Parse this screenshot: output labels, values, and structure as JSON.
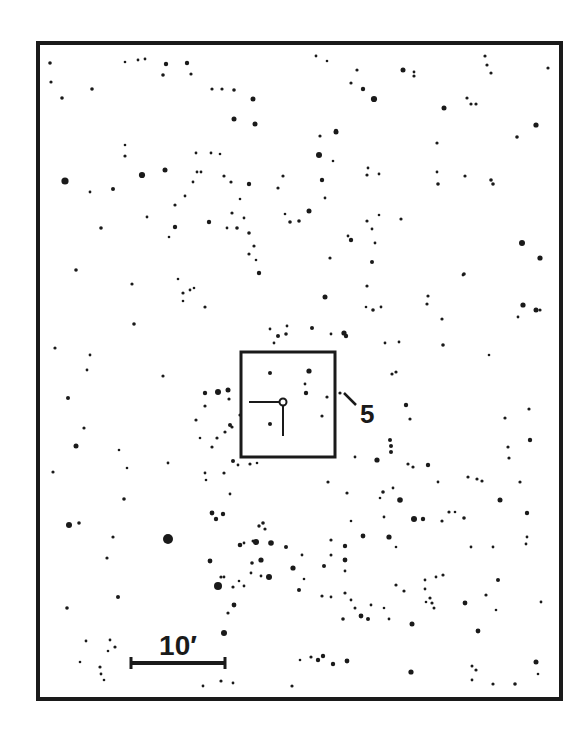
{
  "chart_data": {
    "type": "scatter",
    "frame": {
      "x": 38,
      "y": 43,
      "width": 523,
      "height": 656
    },
    "target_box": {
      "x": 241,
      "y": 352,
      "width": 94,
      "height": 105
    },
    "target": {
      "x": 283,
      "y": 402,
      "radius": 3.5
    },
    "reticle": {
      "h": {
        "x1": 249,
        "x2": 279,
        "y": 402
      },
      "v": {
        "x": 283,
        "y1": 406,
        "y2": 436
      }
    },
    "label": {
      "text": "5",
      "x": 360,
      "y": 423,
      "size": 26
    },
    "leader": {
      "x1": 344,
      "y1": 393,
      "x2": 356,
      "y2": 405
    },
    "scale_bar": {
      "label": "10′",
      "x1": 131,
      "x2": 225,
      "y": 663,
      "label_x": 178,
      "label_y": 655,
      "label_size": 28
    },
    "stars": [
      [
        50,
        63,
        1.8
      ],
      [
        51,
        82,
        1.6
      ],
      [
        62,
        98,
        1.8
      ],
      [
        92,
        89,
        1.8
      ],
      [
        65,
        181,
        3.6
      ],
      [
        90,
        192,
        1.4
      ],
      [
        113,
        189,
        2.0
      ],
      [
        125,
        145,
        1.3
      ],
      [
        125,
        156,
        1.6
      ],
      [
        142,
        175,
        3.1
      ],
      [
        165,
        170,
        2.5
      ],
      [
        175,
        227,
        2.2
      ],
      [
        209,
        222,
        2.2
      ],
      [
        185,
        196,
        1.4
      ],
      [
        193,
        182,
        1.4
      ],
      [
        201,
        172,
        1.4
      ],
      [
        125,
        62,
        1.3
      ],
      [
        138,
        60,
        1.4
      ],
      [
        145,
        59,
        1.4
      ],
      [
        166,
        64,
        2.2
      ],
      [
        187,
        63,
        2.2
      ],
      [
        163,
        75,
        1.8
      ],
      [
        191,
        74,
        1.6
      ],
      [
        212,
        89,
        1.6
      ],
      [
        222,
        89,
        1.6
      ],
      [
        234,
        90,
        1.8
      ],
      [
        253,
        99,
        2.5
      ],
      [
        234,
        119,
        2.5
      ],
      [
        255,
        124,
        2.5
      ],
      [
        196,
        153,
        1.4
      ],
      [
        211,
        153,
        1.4
      ],
      [
        220,
        154,
        1.3
      ],
      [
        197,
        172,
        1.4
      ],
      [
        224,
        176,
        1.6
      ],
      [
        231,
        182,
        1.6
      ],
      [
        249,
        184,
        2.2
      ],
      [
        240,
        199,
        1.3
      ],
      [
        283,
        176,
        1.6
      ],
      [
        278,
        188,
        1.6
      ],
      [
        244,
        218,
        1.4
      ],
      [
        249,
        233,
        1.8
      ],
      [
        237,
        228,
        1.8
      ],
      [
        232,
        213,
        1.6
      ],
      [
        227,
        228,
        1.4
      ],
      [
        316,
        56,
        1.4
      ],
      [
        327,
        61,
        1.3
      ],
      [
        357,
        70,
        1.6
      ],
      [
        403,
        70,
        2.5
      ],
      [
        414,
        76,
        1.6
      ],
      [
        414,
        72,
        1.4
      ],
      [
        351,
        83,
        1.6
      ],
      [
        363,
        89,
        2.2
      ],
      [
        374,
        99,
        3.1
      ],
      [
        285,
        214,
        1.3
      ],
      [
        290,
        222,
        1.8
      ],
      [
        299,
        221,
        1.8
      ],
      [
        309,
        211,
        2.5
      ],
      [
        319,
        155,
        3.0
      ],
      [
        325,
        198,
        1.4
      ],
      [
        333,
        161,
        1.3
      ],
      [
        336,
        132,
        2.5
      ],
      [
        320,
        136,
        1.6
      ],
      [
        444,
        108,
        2.5
      ],
      [
        467,
        98,
        1.6
      ],
      [
        471,
        104,
        1.6
      ],
      [
        476,
        104,
        1.6
      ],
      [
        491,
        180,
        1.8
      ],
      [
        493,
        184,
        1.8
      ],
      [
        485,
        56,
        1.6
      ],
      [
        487,
        65,
        1.6
      ],
      [
        491,
        73,
        1.6
      ],
      [
        548,
        68,
        1.6
      ],
      [
        536,
        125,
        2.6
      ],
      [
        517,
        137,
        1.8
      ],
      [
        465,
        176,
        1.6
      ],
      [
        438,
        184,
        1.8
      ],
      [
        437,
        172,
        1.4
      ],
      [
        368,
        168,
        1.4
      ],
      [
        367,
        175,
        1.6
      ],
      [
        379,
        174,
        1.4
      ],
      [
        437,
        143,
        1.6
      ],
      [
        336,
        131,
        2.2
      ],
      [
        322,
        180,
        2.2
      ],
      [
        76,
        270,
        1.8
      ],
      [
        132,
        284,
        1.6
      ],
      [
        134,
        324,
        1.8
      ],
      [
        101,
        228,
        1.8
      ],
      [
        147,
        217,
        1.4
      ],
      [
        169,
        237,
        1.3
      ],
      [
        175,
        205,
        1.6
      ],
      [
        178,
        279,
        1.3
      ],
      [
        183,
        293,
        1.6
      ],
      [
        183,
        301,
        1.3
      ],
      [
        194,
        288,
        1.3
      ],
      [
        205,
        307,
        1.6
      ],
      [
        190,
        290,
        1.4
      ],
      [
        249,
        254,
        1.6
      ],
      [
        254,
        246,
        1.6
      ],
      [
        256,
        260,
        1.3
      ],
      [
        259,
        273,
        2.2
      ],
      [
        270,
        329,
        1.4
      ],
      [
        287,
        326,
        1.4
      ],
      [
        278,
        336,
        2.0
      ],
      [
        286,
        334,
        1.8
      ],
      [
        312,
        328,
        2.0
      ],
      [
        325,
        297,
        2.5
      ],
      [
        344,
        333,
        2.6
      ],
      [
        346,
        336,
        2.2
      ],
      [
        331,
        334,
        1.4
      ],
      [
        274,
        343,
        1.4
      ],
      [
        367,
        221,
        1.6
      ],
      [
        379,
        215,
        1.3
      ],
      [
        372,
        229,
        1.4
      ],
      [
        351,
        240,
        2.2
      ],
      [
        348,
        236,
        1.4
      ],
      [
        372,
        262,
        2.0
      ],
      [
        375,
        243,
        1.4
      ],
      [
        330,
        258,
        1.6
      ],
      [
        367,
        286,
        1.6
      ],
      [
        366,
        307,
        1.3
      ],
      [
        381,
        307,
        1.4
      ],
      [
        373,
        310,
        1.8
      ],
      [
        401,
        219,
        1.6
      ],
      [
        442,
        319,
        1.6
      ],
      [
        428,
        296,
        1.6
      ],
      [
        427,
        304,
        1.6
      ],
      [
        399,
        342,
        1.4
      ],
      [
        385,
        343,
        1.4
      ],
      [
        443,
        345,
        1.8
      ],
      [
        463,
        275,
        1.4
      ],
      [
        522,
        243,
        3.0
      ],
      [
        540,
        258,
        2.6
      ],
      [
        518,
        317,
        1.4
      ],
      [
        540,
        310,
        1.6
      ],
      [
        464,
        274,
        1.8
      ],
      [
        523,
        305,
        2.6
      ],
      [
        536,
        310,
        2.5
      ],
      [
        489,
        355,
        1.3
      ],
      [
        55,
        348,
        1.6
      ],
      [
        90,
        355,
        1.4
      ],
      [
        87,
        370,
        1.4
      ],
      [
        68,
        398,
        2.0
      ],
      [
        76,
        446,
        2.5
      ],
      [
        53,
        472,
        1.6
      ],
      [
        69,
        525,
        3.0
      ],
      [
        79,
        523,
        1.8
      ],
      [
        84,
        428,
        1.6
      ],
      [
        119,
        450,
        1.3
      ],
      [
        127,
        468,
        1.3
      ],
      [
        113,
        537,
        1.6
      ],
      [
        124,
        499,
        1.8
      ],
      [
        163,
        376,
        1.6
      ],
      [
        168,
        463,
        1.4
      ],
      [
        205,
        393,
        2.2
      ],
      [
        205,
        473,
        1.4
      ],
      [
        218,
        392,
        3.0
      ],
      [
        228,
        390,
        2.5
      ],
      [
        229,
        399,
        1.6
      ],
      [
        225,
        432,
        1.6
      ],
      [
        230,
        425,
        2.0
      ],
      [
        205,
        406,
        1.6
      ],
      [
        212,
        447,
        1.6
      ],
      [
        217,
        438,
        1.6
      ],
      [
        233,
        461,
        2.0
      ],
      [
        232,
        427,
        1.6
      ],
      [
        240,
        415,
        1.6
      ],
      [
        250,
        464,
        1.6
      ],
      [
        238,
        465,
        1.4
      ],
      [
        257,
        463,
        1.3
      ],
      [
        206,
        480,
        1.3
      ],
      [
        224,
        473,
        1.6
      ],
      [
        196,
        420,
        1.6
      ],
      [
        200,
        438,
        1.3
      ],
      [
        270,
        373,
        2.0
      ],
      [
        309,
        371,
        2.6
      ],
      [
        305,
        384,
        1.4
      ],
      [
        306,
        393,
        2.2
      ],
      [
        322,
        416,
        1.6
      ],
      [
        270,
        424,
        2.0
      ],
      [
        327,
        397,
        1.6
      ],
      [
        340,
        393,
        1.6
      ],
      [
        392,
        374,
        1.6
      ],
      [
        396,
        372,
        1.6
      ],
      [
        406,
        405,
        2.2
      ],
      [
        410,
        419,
        1.6
      ],
      [
        390,
        440,
        2.0
      ],
      [
        391,
        446,
        2.0
      ],
      [
        391,
        452,
        2.0
      ],
      [
        355,
        457,
        1.4
      ],
      [
        377,
        460,
        2.6
      ],
      [
        408,
        464,
        1.6
      ],
      [
        413,
        467,
        1.6
      ],
      [
        428,
        465,
        2.2
      ],
      [
        393,
        488,
        1.4
      ],
      [
        328,
        482,
        1.6
      ],
      [
        383,
        492,
        1.8
      ],
      [
        380,
        498,
        1.3
      ],
      [
        438,
        482,
        1.4
      ],
      [
        468,
        477,
        1.6
      ],
      [
        477,
        479,
        1.6
      ],
      [
        500,
        500,
        2.5
      ],
      [
        520,
        482,
        1.6
      ],
      [
        482,
        481,
        1.6
      ],
      [
        530,
        440,
        2.2
      ],
      [
        529,
        409,
        1.6
      ],
      [
        505,
        418,
        1.6
      ],
      [
        508,
        447,
        1.6
      ],
      [
        509,
        458,
        1.6
      ],
      [
        384,
        517,
        1.4
      ],
      [
        400,
        500,
        2.8
      ],
      [
        414,
        519,
        3.0
      ],
      [
        423,
        519,
        2.2
      ],
      [
        442,
        521,
        1.6
      ],
      [
        449,
        512,
        1.6
      ],
      [
        455,
        512,
        1.3
      ],
      [
        464,
        518,
        1.8
      ],
      [
        527,
        513,
        2.2
      ],
      [
        363,
        536,
        2.4
      ],
      [
        389,
        537,
        2.6
      ],
      [
        396,
        547,
        1.3
      ],
      [
        471,
        547,
        1.4
      ],
      [
        493,
        547,
        1.4
      ],
      [
        527,
        537,
        1.4
      ],
      [
        526,
        544,
        1.4
      ],
      [
        168,
        539,
        5.0
      ],
      [
        212,
        513,
        2.4
      ],
      [
        216,
        519,
        2.2
      ],
      [
        223,
        514,
        2.2
      ],
      [
        230,
        494,
        1.4
      ],
      [
        240,
        545,
        2.3
      ],
      [
        244,
        543,
        1.4
      ],
      [
        253,
        541,
        1.5
      ],
      [
        256,
        542,
        3.0
      ],
      [
        259,
        526,
        1.7
      ],
      [
        263,
        523,
        1.8
      ],
      [
        265,
        529,
        1.6
      ],
      [
        271,
        543,
        2.8
      ],
      [
        261,
        560,
        2.6
      ],
      [
        286,
        547,
        2.0
      ],
      [
        293,
        568,
        2.6
      ],
      [
        269,
        577,
        3.0
      ],
      [
        261,
        576,
        1.4
      ],
      [
        302,
        555,
        1.4
      ],
      [
        324,
        566,
        2.0
      ],
      [
        331,
        555,
        1.5
      ],
      [
        299,
        590,
        2.0
      ],
      [
        322,
        596,
        1.6
      ],
      [
        331,
        597,
        1.4
      ],
      [
        304,
        579,
        1.3
      ],
      [
        345,
        546,
        2.2
      ],
      [
        331,
        540,
        1.6
      ],
      [
        347,
        493,
        1.6
      ],
      [
        351,
        521,
        1.3
      ],
      [
        218,
        586,
        4.0
      ],
      [
        210,
        561,
        2.4
      ],
      [
        221,
        577,
        1.6
      ],
      [
        107,
        558,
        1.6
      ],
      [
        118,
        597,
        2.0
      ],
      [
        67,
        608,
        1.8
      ],
      [
        86,
        641,
        1.4
      ],
      [
        80,
        662,
        1.3
      ],
      [
        110,
        640,
        1.4
      ],
      [
        115,
        647,
        1.6
      ],
      [
        108,
        651,
        1.3
      ],
      [
        100,
        667,
        1.6
      ],
      [
        101,
        674,
        1.4
      ],
      [
        104,
        680,
        1.3
      ],
      [
        224,
        577,
        1.4
      ],
      [
        233,
        587,
        1.6
      ],
      [
        228,
        613,
        1.6
      ],
      [
        224,
        633,
        3.0
      ],
      [
        234,
        605,
        2.4
      ],
      [
        244,
        586,
        1.4
      ],
      [
        251,
        573,
        1.4
      ],
      [
        239,
        581,
        1.3
      ],
      [
        252,
        563,
        1.8
      ],
      [
        203,
        686,
        1.4
      ],
      [
        221,
        681,
        1.6
      ],
      [
        233,
        683,
        1.4
      ],
      [
        292,
        686,
        1.6
      ],
      [
        300,
        660,
        1.3
      ],
      [
        311,
        657,
        1.6
      ],
      [
        318,
        660,
        2.2
      ],
      [
        323,
        656,
        2.2
      ],
      [
        333,
        664,
        2.2
      ],
      [
        347,
        661,
        2.4
      ],
      [
        345,
        560,
        2.4
      ],
      [
        345,
        593,
        1.6
      ],
      [
        351,
        600,
        1.4
      ],
      [
        361,
        616,
        2.4
      ],
      [
        355,
        608,
        1.5
      ],
      [
        368,
        619,
        2.0
      ],
      [
        371,
        605,
        1.4
      ],
      [
        384,
        608,
        1.3
      ],
      [
        389,
        619,
        1.4
      ],
      [
        396,
        585,
        1.6
      ],
      [
        404,
        591,
        1.6
      ],
      [
        412,
        624,
        2.5
      ],
      [
        343,
        619,
        1.8
      ],
      [
        345,
        571,
        1.4
      ],
      [
        411,
        672,
        2.6
      ],
      [
        425,
        589,
        1.4
      ],
      [
        430,
        598,
        1.6
      ],
      [
        425,
        580,
        1.4
      ],
      [
        432,
        603,
        1.6
      ],
      [
        434,
        608,
        1.5
      ],
      [
        426,
        602,
        1.3
      ],
      [
        436,
        577,
        1.4
      ],
      [
        443,
        575,
        1.6
      ],
      [
        465,
        603,
        2.4
      ],
      [
        486,
        595,
        1.6
      ],
      [
        498,
        580,
        2.0
      ],
      [
        496,
        610,
        1.3
      ],
      [
        478,
        631,
        2.4
      ],
      [
        472,
        666,
        1.5
      ],
      [
        476,
        670,
        1.6
      ],
      [
        472,
        680,
        1.4
      ],
      [
        493,
        684,
        1.6
      ],
      [
        515,
        684,
        1.8
      ],
      [
        536,
        662,
        2.5
      ],
      [
        538,
        674,
        1.3
      ],
      [
        541,
        602,
        1.4
      ]
    ]
  }
}
